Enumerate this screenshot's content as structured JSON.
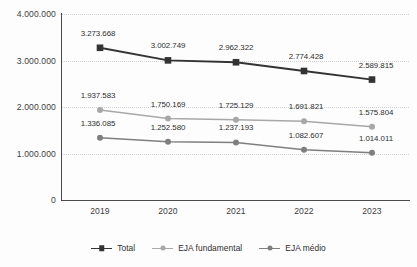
{
  "chart_data": {
    "type": "line",
    "title": "",
    "xlabel": "",
    "ylabel": "",
    "categories": [
      "2019",
      "2020",
      "2021",
      "2022",
      "2023"
    ],
    "ylim": [
      0,
      4000000
    ],
    "yticks": [
      0,
      1000000,
      2000000,
      3000000,
      4000000
    ],
    "ytick_labels": [
      "0",
      "1.000.000",
      "2.000.000",
      "3.000.000",
      "4.000.000"
    ],
    "grid": true,
    "legend_position": "bottom",
    "number_format": "pt-BR (dot thousands separator)",
    "series": [
      {
        "name": "Total",
        "color": "#333333",
        "marker": "square",
        "values": [
          3273668,
          3002749,
          2962322,
          2774428,
          2589815
        ],
        "labels": [
          "3.273.668",
          "3.002.749",
          "2.962.322",
          "2.774.428",
          "2.589.815"
        ]
      },
      {
        "name": "EJA fundamental",
        "color": "#a8a8a8",
        "marker": "circle",
        "values": [
          1937583,
          1750169,
          1725129,
          1691821,
          1575804
        ],
        "labels": [
          "1.937.583",
          "1.750.169",
          "1.725.129",
          "1.691.821",
          "1.575.804"
        ]
      },
      {
        "name": "EJA médio",
        "color": "#7f7f7f",
        "marker": "circle",
        "values": [
          1336085,
          1252580,
          1237193,
          1082607,
          1014011
        ],
        "labels": [
          "1.336.085",
          "1.252.580",
          "1.237.193",
          "1.082.607",
          "1.014.011"
        ]
      }
    ]
  },
  "legend": {
    "items": [
      {
        "label": "Total",
        "color": "#333333",
        "marker": "square"
      },
      {
        "label": "EJA fundamental",
        "color": "#a8a8a8",
        "marker": "circle"
      },
      {
        "label": "EJA médio",
        "color": "#7f7f7f",
        "marker": "circle"
      }
    ]
  },
  "title_remnant": {
    "text": ""
  }
}
